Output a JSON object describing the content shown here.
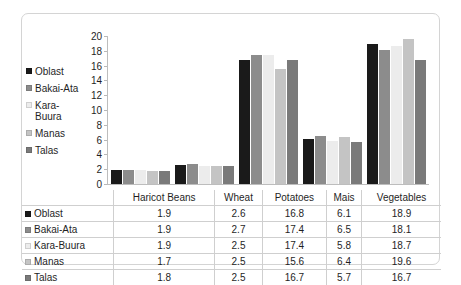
{
  "chart_data": {
    "type": "bar",
    "title": "",
    "subtitle": "",
    "xlabel": "",
    "ylabel": "",
    "categories": [
      "Haricot Beans",
      "Wheat",
      "Potatoes",
      "Mais",
      "Vegetables"
    ],
    "series": [
      {
        "name": "Oblast",
        "values": [
          1.9,
          2.6,
          16.8,
          6.1,
          18.9
        ],
        "color": "#1a1a1a"
      },
      {
        "name": "Bakai-Ata",
        "values": [
          1.9,
          2.7,
          17.4,
          6.5,
          18.1
        ],
        "color": "#8c8c8c"
      },
      {
        "name": "Kara-Buura",
        "values": [
          1.9,
          2.5,
          17.4,
          5.8,
          18.7
        ],
        "color": "#ececec"
      },
      {
        "name": "Manas",
        "values": [
          1.7,
          2.5,
          15.6,
          6.4,
          19.6
        ],
        "color": "#c4c4c4"
      },
      {
        "name": "Talas",
        "values": [
          1.8,
          2.5,
          16.7,
          5.7,
          16.7
        ],
        "color": "#7a7a7a"
      }
    ],
    "ylim": [
      0,
      20
    ],
    "yticks": [
      0,
      2,
      4,
      6,
      8,
      10,
      12,
      14,
      16,
      18,
      20
    ],
    "ytick_labels": [
      "0",
      "2",
      "4",
      "6",
      "8",
      "10",
      "12",
      "14",
      "16",
      "18",
      "20"
    ],
    "grid": false,
    "legend_position": "left",
    "legend_labels": [
      "Oblast",
      "Bakai-Ata",
      "Kara-\nBuura",
      "Manas",
      "Talas"
    ],
    "table_visible": true,
    "table": {
      "corner_label": "",
      "column_headers": [
        "Haricot Beans",
        "Wheat",
        "Potatoes",
        "Mais",
        "Vegetables"
      ],
      "rows": [
        {
          "label": "Oblast",
          "cells": [
            "1.9",
            "2.6",
            "16.8",
            "6.1",
            "18.9"
          ]
        },
        {
          "label": "Bakai-Ata",
          "cells": [
            "1.9",
            "2.7",
            "17.4",
            "6.5",
            "18.1"
          ]
        },
        {
          "label": "Kara-Buura",
          "cells": [
            "1.9",
            "2.5",
            "17.4",
            "5.8",
            "18.7"
          ]
        },
        {
          "label": "Manas",
          "cells": [
            "1.7",
            "2.5",
            "15.6",
            "6.4",
            "19.6"
          ]
        },
        {
          "label": "Talas",
          "cells": [
            "1.8",
            "2.5",
            "16.7",
            "5.7",
            "16.7"
          ]
        }
      ]
    }
  }
}
